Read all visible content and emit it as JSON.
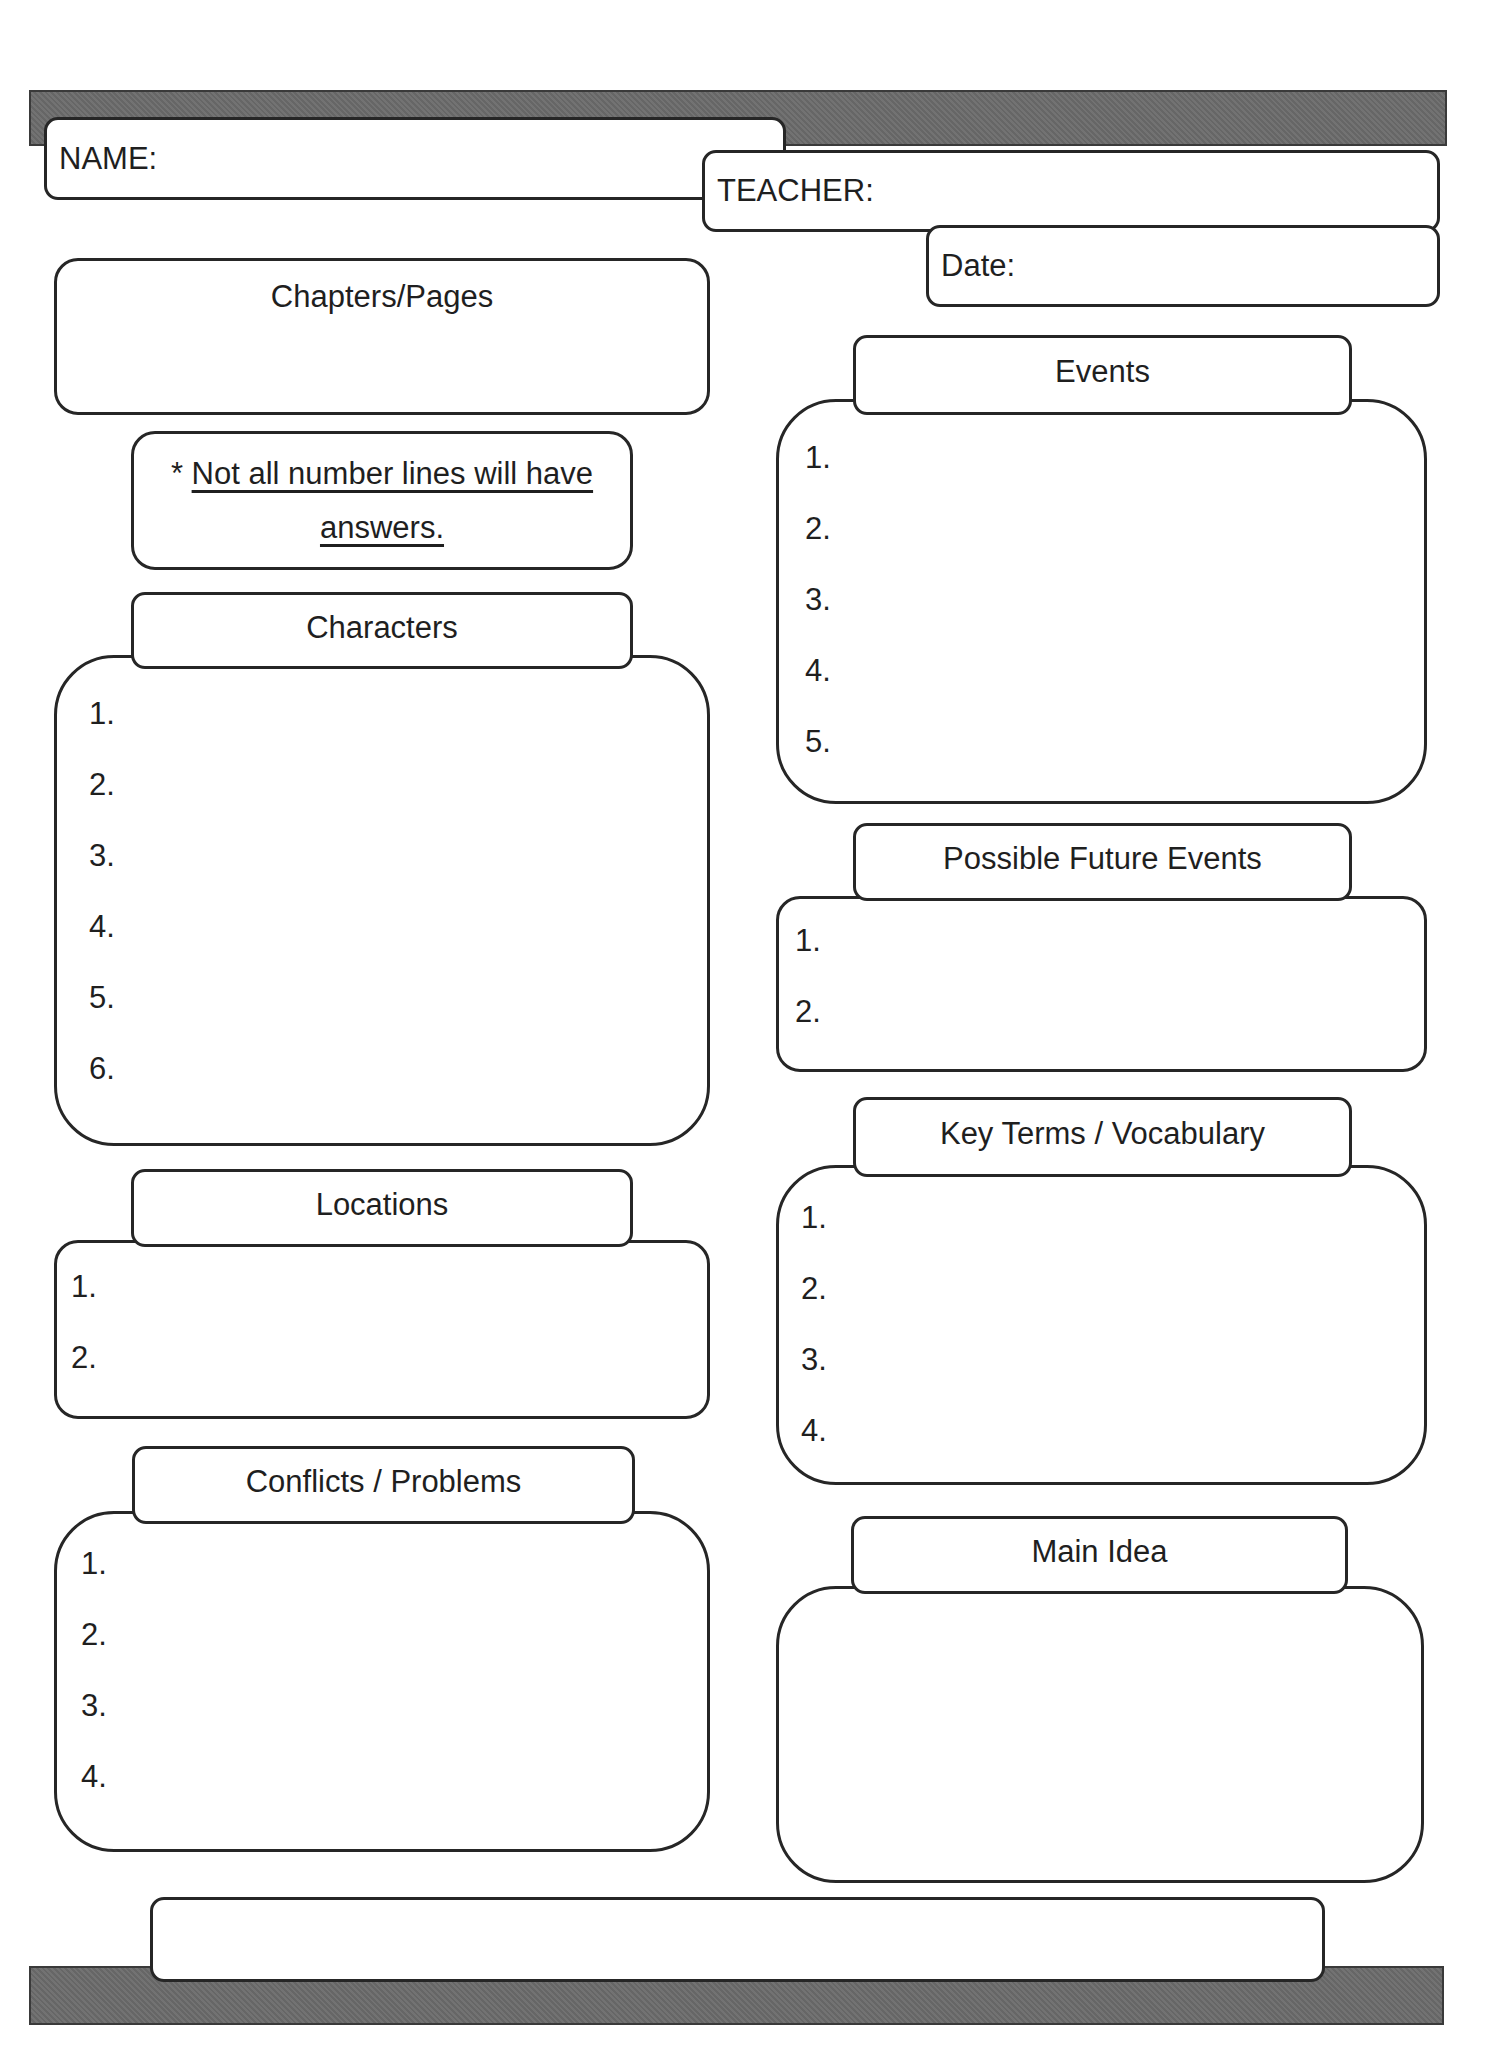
{
  "header": {
    "name_label": "NAME:",
    "teacher_label": "TEACHER:",
    "date_label": "Date:"
  },
  "chapters": {
    "title": "Chapters/Pages"
  },
  "note": {
    "asterisk": "*",
    "line1": "Not all number lines will have",
    "line2": "answers."
  },
  "sections": {
    "characters": {
      "title": "Characters",
      "items": [
        "1.",
        "2.",
        "3.",
        "4.",
        "5.",
        "6."
      ]
    },
    "locations": {
      "title": "Locations",
      "items": [
        "1.",
        "2."
      ]
    },
    "conflicts": {
      "title": "Conflicts / Problems",
      "items": [
        "1.",
        "2.",
        "3.",
        "4."
      ]
    },
    "events": {
      "title": "Events",
      "items": [
        "1.",
        "2.",
        "3.",
        "4.",
        "5."
      ]
    },
    "future_events": {
      "title": "Possible Future Events",
      "items": [
        "1.",
        "2."
      ]
    },
    "key_terms": {
      "title": "Key Terms / Vocabulary",
      "items": [
        "1.",
        "2.",
        "3.",
        "4."
      ]
    },
    "main_idea": {
      "title": "Main Idea"
    }
  },
  "colors": {
    "bar": "#6b6b6b",
    "border": "#262626",
    "text": "#1f1f1f"
  }
}
